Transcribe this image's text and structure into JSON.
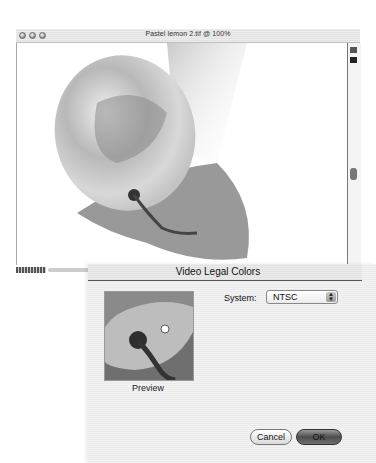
{
  "document_window": {
    "title": "Pastel lemon 2.tif @ 100%",
    "zoom_level": "100%",
    "traffic_lights": [
      "close",
      "minimize",
      "zoom"
    ]
  },
  "dialog": {
    "title": "Video Legal Colors",
    "preview_label": "Preview",
    "system_label": "System:",
    "system_value": "NTSC",
    "cancel_label": "Cancel",
    "ok_label": "OK",
    "cursor_icon": "hand-cursor-icon"
  },
  "colors": {
    "dialog_bg": "#efefef",
    "default_button": "#5a5a5a"
  }
}
